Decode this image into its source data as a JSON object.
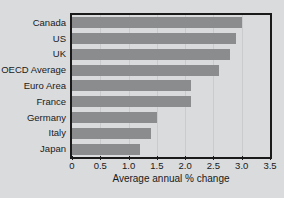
{
  "chart_data": {
    "type": "bar",
    "orientation": "horizontal",
    "title": "",
    "subtitle": "",
    "xlabel": "Average annual % change",
    "ylabel": "",
    "xlim": [
      0,
      3.5
    ],
    "xticks": [
      "0",
      "0.5",
      "1.0",
      "1.5",
      "2.0",
      "2.5",
      "3.0",
      "3.5"
    ],
    "xtick_values": [
      0,
      0.5,
      1.0,
      1.5,
      2.0,
      2.5,
      3.0,
      3.5
    ],
    "grid": true,
    "legend": "none",
    "categories": [
      "Canada",
      "US",
      "UK",
      "OECD Average",
      "Euro Area",
      "France",
      "Germany",
      "Italy",
      "Japan"
    ],
    "values": [
      3.0,
      2.9,
      2.8,
      2.6,
      2.1,
      2.1,
      1.5,
      1.4,
      1.2
    ],
    "bar_color": "#8b8c8e",
    "background_color": "#d9dbdd",
    "axis_color": "#1a1a1a",
    "gridline_color": "#c9cbcd"
  }
}
